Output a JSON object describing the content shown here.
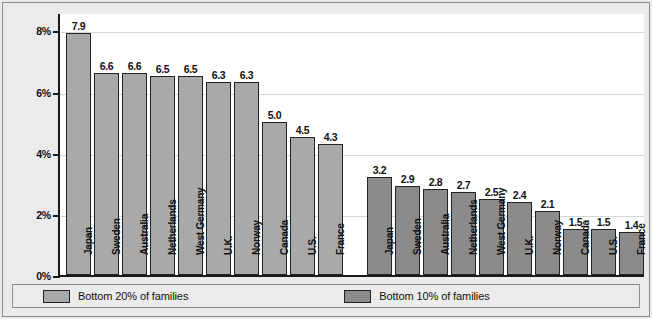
{
  "chart_data": {
    "type": "bar",
    "title": "",
    "subtitle": "",
    "xlabel": "",
    "ylabel": "",
    "ylim": [
      0,
      8.6
    ],
    "yticks": [
      0,
      2,
      4,
      6,
      8
    ],
    "ytick_labels": [
      "0%",
      "2%",
      "4%",
      "6%",
      "8%"
    ],
    "grid": true,
    "legend_position": "bottom",
    "groups": [
      {
        "name": "Bottom 20% of families",
        "color": "#a9a9a9",
        "categories": [
          "Japan",
          "Sweden",
          "Australia",
          "Netherlands",
          "West Germany",
          "U.K.",
          "Norway",
          "Canada",
          "U.S.",
          "France"
        ],
        "values": [
          7.9,
          6.6,
          6.6,
          6.5,
          6.5,
          6.3,
          6.3,
          5.0,
          4.5,
          4.3
        ],
        "value_labels": [
          "7.9",
          "6.6",
          "6.6",
          "6.5",
          "6.5",
          "6.3",
          "6.3",
          "5.0",
          "4.5",
          "4.3"
        ]
      },
      {
        "name": "Bottom 10% of families",
        "color": "#8b8b8b",
        "categories": [
          "Japan",
          "Sweden",
          "Australia",
          "Netherlands",
          "West Germany",
          "U.K.",
          "Norway",
          "Canada",
          "U.S.",
          "France"
        ],
        "values": [
          3.2,
          2.9,
          2.8,
          2.7,
          2.5,
          2.4,
          2.1,
          1.5,
          1.5,
          1.4
        ],
        "value_labels": [
          "3.2",
          "2.9",
          "2.8",
          "2.7",
          "2.5",
          "2.4",
          "2.1",
          "1.5",
          "1.5",
          "1.4"
        ]
      }
    ]
  },
  "legend": {
    "entries": [
      {
        "label": "Bottom 20% of families",
        "color": "#a9a9a9"
      },
      {
        "label": "Bottom 10% of families",
        "color": "#8b8b8b"
      }
    ]
  },
  "colors": {
    "series_20": "#a9a9a9",
    "series_10": "#8b8b8b",
    "panel_background": "#ebebeb",
    "plot_background": "#ffffff",
    "axis": "#1a1a1a",
    "gridline": "#d6d6d6",
    "text": "#111111"
  }
}
